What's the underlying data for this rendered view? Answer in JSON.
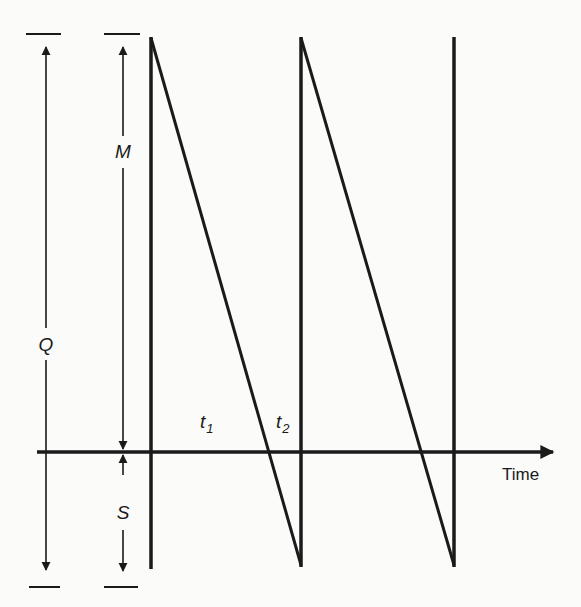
{
  "diagram": {
    "type": "inventory-sawtooth",
    "labels": {
      "total_quantity": "Q",
      "max_inventory": "M",
      "shortage": "S",
      "t1": "t",
      "t1_sub": "1",
      "t2": "t",
      "t2_sub": "2",
      "x_axis": "Time"
    },
    "colors": {
      "line": "#1a1a1a",
      "background": "#fbfbf9"
    }
  }
}
